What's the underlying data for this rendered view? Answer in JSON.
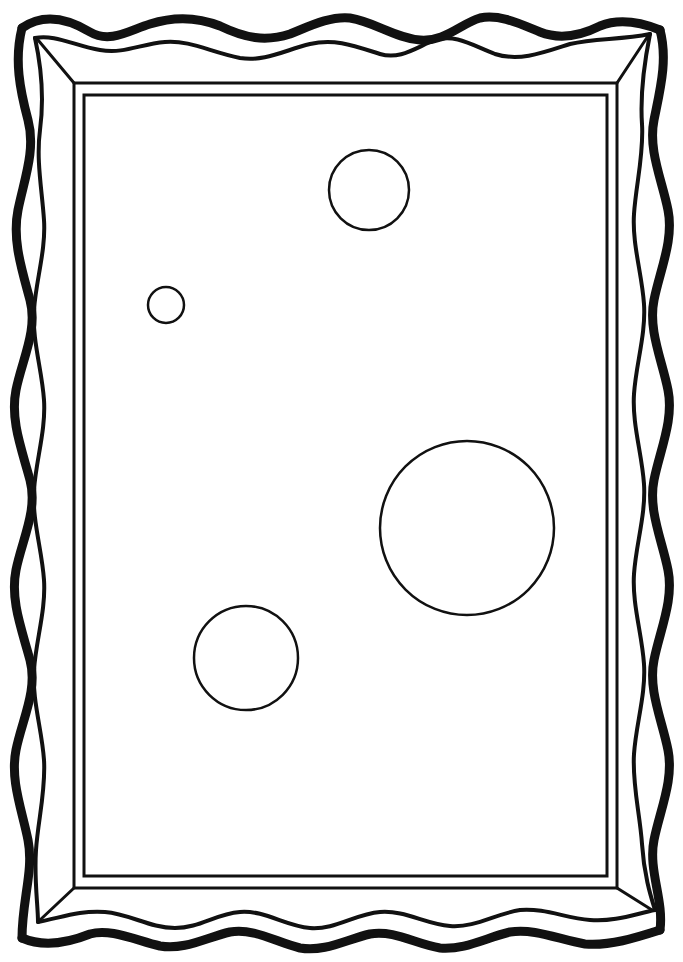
{
  "canvas": {
    "width": 683,
    "height": 962,
    "background": "#ffffff",
    "ink": "#111111"
  },
  "frame": {
    "style": "wavy ornamental picture frame (coloring page)",
    "outer_rect": {
      "x": 74,
      "y": 83,
      "w": 543,
      "h": 805
    },
    "inner_rect": {
      "x": 84,
      "y": 95,
      "w": 523,
      "h": 781
    }
  },
  "circles": [
    {
      "name": "top-circle",
      "cx": 369,
      "cy": 190,
      "r": 40
    },
    {
      "name": "small-circle",
      "cx": 166,
      "cy": 305,
      "r": 18
    },
    {
      "name": "large-circle",
      "cx": 467,
      "cy": 528,
      "r": 87
    },
    {
      "name": "lower-left-circle",
      "cx": 246,
      "cy": 658,
      "r": 52
    }
  ]
}
